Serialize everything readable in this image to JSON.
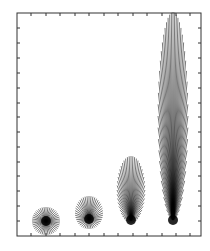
{
  "figure": {
    "width": 210,
    "height": 251,
    "background": "#ffffff",
    "ink_color": "#000000",
    "frame": {
      "x0": 17,
      "y0": 13,
      "x1": 201,
      "y1": 236,
      "stroke": "#333333"
    },
    "ticks": {
      "length": 3,
      "bottom": [
        31,
        46,
        60,
        75,
        89,
        104,
        118,
        133,
        147,
        162,
        176,
        190
      ],
      "top": [
        31,
        46,
        60,
        75,
        89,
        104,
        118,
        133,
        147,
        162,
        176,
        190
      ],
      "left": [
        28,
        43,
        58,
        73,
        88,
        103,
        117,
        132,
        147,
        162,
        176,
        191,
        206,
        221
      ],
      "right": [
        28,
        43,
        58,
        73,
        88,
        103,
        117,
        132,
        147,
        162,
        176,
        191,
        206,
        221
      ]
    },
    "fans": [
      {
        "name": "fan-1",
        "cx": 46,
        "cy": 221,
        "rx": 14,
        "ry_up": 14,
        "ry_down": 14,
        "focus_y": 221,
        "rays": 44
      },
      {
        "name": "fan-2",
        "cx": 89,
        "cy": 213,
        "rx": 14,
        "ry_up": 17,
        "ry_down": 16,
        "focus_y": 219,
        "rays": 44
      },
      {
        "name": "fan-3",
        "cx": 131,
        "cy": 190,
        "rx": 14,
        "ry_up": 34,
        "ry_down": 33,
        "focus_y": 220,
        "rays": 48
      },
      {
        "name": "fan-4",
        "cx": 173,
        "cy": 116,
        "rx": 15,
        "ry_up": 104,
        "ry_down": 104,
        "focus_y": 220,
        "rays": 56
      }
    ]
  }
}
